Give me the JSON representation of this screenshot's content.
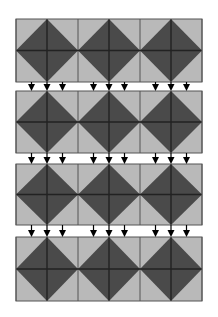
{
  "diagram": {
    "colors": {
      "background": "#ffffff",
      "light_tile": "#b9b9b9",
      "dark_diamond": "#4a4a4a",
      "grid_line": "#222222",
      "cell_border": "#555555",
      "arrow": "#000000"
    },
    "grid": {
      "left": 16,
      "sub_column_width": 31,
      "sub_columns": 6,
      "diamonds_per_row": 3
    },
    "rows": [
      {
        "top": 19,
        "height": 63
      },
      {
        "top": 91,
        "height": 62
      },
      {
        "top": 164,
        "height": 61
      },
      {
        "top": 237,
        "height": 64
      }
    ],
    "arrows": {
      "per_diamond_offsets": [
        -15.5,
        0,
        15.5
      ],
      "head_width": 7,
      "head_height": 6
    }
  }
}
